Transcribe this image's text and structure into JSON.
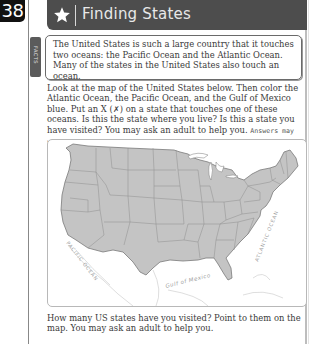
{
  "page": {
    "number": "38"
  },
  "header": {
    "icon": "star-icon",
    "title": "Finding States",
    "background": "#4d4d4d"
  },
  "facts": {
    "tab_label": "FACTS",
    "text": "The United States is such a large country that it touches two oceans: the Pacific Ocean and the Atlantic Ocean. Many of the states in the United States also touch an ocean."
  },
  "instructions": {
    "text": "Look at the map of the United States below. Then color the Atlantic Ocean, the Pacific Ocean, and the Gulf of Mexico blue. Put an X (✗) on a state that touches one of these oceans. Is this the state where you live? Is this a state you have visited? You may ask an adult to help you.",
    "answer": "Answers may vary"
  },
  "map": {
    "labels": {
      "pacific": "PACIFIC OCEAN",
      "atlantic": "ATLANTIC OCEAN",
      "gulf": "Gulf of Mexico"
    },
    "land_color": "#c4c4c4",
    "border_color": "#8a8a8a"
  },
  "bottom": {
    "text": "How many US states have you visited? Point to them on the map. You may ask an adult to help you."
  }
}
